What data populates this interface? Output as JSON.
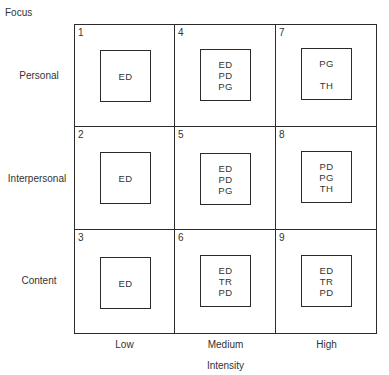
{
  "diagram": {
    "y_axis_title": "Focus",
    "x_axis_title": "Intensity",
    "rows": [
      "Personal",
      "Interpersonal",
      "Content"
    ],
    "columns": [
      "Low",
      "Medium",
      "High"
    ],
    "cells": [
      {
        "number": "1",
        "row": 0,
        "col": 0,
        "items": [
          "ED"
        ]
      },
      {
        "number": "4",
        "row": 0,
        "col": 1,
        "items": [
          "ED",
          "PD",
          "PG"
        ]
      },
      {
        "number": "7",
        "row": 0,
        "col": 2,
        "items": [
          "PG",
          "",
          "TH"
        ]
      },
      {
        "number": "2",
        "row": 1,
        "col": 0,
        "items": [
          "ED"
        ]
      },
      {
        "number": "5",
        "row": 1,
        "col": 1,
        "items": [
          "ED",
          "PD",
          "PG"
        ]
      },
      {
        "number": "8",
        "row": 1,
        "col": 2,
        "items": [
          "PD",
          "PG",
          "TH"
        ]
      },
      {
        "number": "3",
        "row": 2,
        "col": 0,
        "items": [
          "ED"
        ]
      },
      {
        "number": "6",
        "row": 2,
        "col": 1,
        "items": [
          "ED",
          "TR",
          "PD"
        ]
      },
      {
        "number": "9",
        "row": 2,
        "col": 2,
        "items": [
          "ED",
          "TR",
          "PD"
        ]
      }
    ]
  }
}
